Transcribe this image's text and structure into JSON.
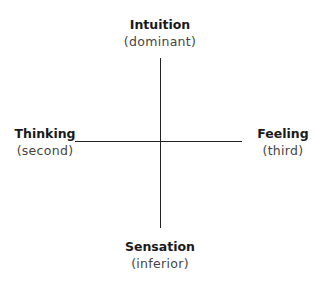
{
  "diagram": {
    "type": "axes-cross",
    "top": {
      "title": "Intuition",
      "role": "(dominant)"
    },
    "left": {
      "title": "Thinking",
      "role": "(second)"
    },
    "right": {
      "title": "Feeling",
      "role": "(third)"
    },
    "bottom": {
      "title": "Sensation",
      "role": "(inferior)"
    },
    "line_color": "#222222"
  }
}
